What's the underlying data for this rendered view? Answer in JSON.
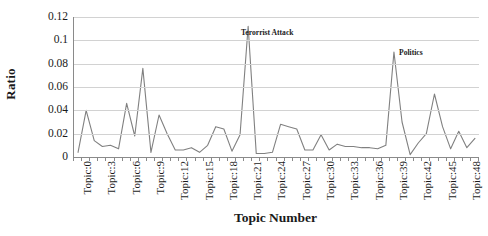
{
  "chart_data": {
    "type": "line",
    "title": "",
    "xlabel": "Topic Number",
    "ylabel": "Ratio",
    "ylim": [
      0,
      0.12
    ],
    "yticks": [
      "0",
      "0.02",
      "0.04",
      "0.06",
      "0.08",
      "0.1",
      "0.12"
    ],
    "ytick_values": [
      0,
      0.02,
      0.04,
      0.06,
      0.08,
      0.1,
      0.12
    ],
    "grid": true,
    "legend": "none",
    "series_color": "#808080",
    "x": [
      0,
      1,
      2,
      3,
      4,
      5,
      6,
      7,
      8,
      9,
      10,
      11,
      12,
      13,
      14,
      15,
      16,
      17,
      18,
      19,
      20,
      21,
      22,
      23,
      24,
      25,
      26,
      27,
      28,
      29,
      30,
      31,
      32,
      33,
      34,
      35,
      36,
      37,
      38,
      39,
      40,
      41,
      42,
      43,
      44,
      45,
      46,
      47,
      48,
      49
    ],
    "xtick_labels": [
      "Topic:0",
      "Topic:3",
      "Topic:6",
      "Topic:9",
      "Topic:12",
      "Topic:15",
      "Topic:18",
      "Topic:21",
      "Topic:24",
      "Topic:27",
      "Topic:30",
      "Topic:33",
      "Topic:36",
      "Topic:39",
      "Topic:42",
      "Topic:45",
      "Topic:48"
    ],
    "xtick_positions": [
      0,
      3,
      6,
      9,
      12,
      15,
      18,
      21,
      24,
      27,
      30,
      33,
      36,
      39,
      42,
      45,
      48
    ],
    "categories": [
      "Topic:0",
      "Topic:1",
      "Topic:2",
      "Topic:3",
      "Topic:4",
      "Topic:5",
      "Topic:6",
      "Topic:7",
      "Topic:8",
      "Topic:9",
      "Topic:10",
      "Topic:11",
      "Topic:12",
      "Topic:13",
      "Topic:14",
      "Topic:15",
      "Topic:16",
      "Topic:17",
      "Topic:18",
      "Topic:19",
      "Topic:20",
      "Topic:21",
      "Topic:22",
      "Topic:23",
      "Topic:24",
      "Topic:25",
      "Topic:26",
      "Topic:27",
      "Topic:28",
      "Topic:29",
      "Topic:30",
      "Topic:31",
      "Topic:32",
      "Topic:33",
      "Topic:34",
      "Topic:35",
      "Topic:36",
      "Topic:37",
      "Topic:38",
      "Topic:39",
      "Topic:40",
      "Topic:41",
      "Topic:42",
      "Topic:43",
      "Topic:44",
      "Topic:45",
      "Topic:46",
      "Topic:47",
      "Topic:48",
      "Topic:49"
    ],
    "values": [
      0.004,
      0.04,
      0.014,
      0.009,
      0.01,
      0.007,
      0.046,
      0.018,
      0.076,
      0.004,
      0.036,
      0.02,
      0.006,
      0.006,
      0.008,
      0.004,
      0.01,
      0.026,
      0.024,
      0.005,
      0.019,
      0.112,
      0.003,
      0.003,
      0.004,
      0.028,
      0.026,
      0.024,
      0.006,
      0.006,
      0.019,
      0.006,
      0.011,
      0.009,
      0.009,
      0.008,
      0.008,
      0.007,
      0.01,
      0.09,
      0.03,
      0.002,
      0.012,
      0.02,
      0.054,
      0.026,
      0.007,
      0.022,
      0.008,
      0.016
    ],
    "annotations": [
      {
        "text": "Terorrist Attack",
        "x_index": 21,
        "value": 0.112,
        "label_x": 241,
        "label_y": 28
      },
      {
        "text": "Politics",
        "x_index": 39,
        "value": 0.09,
        "label_x": 399,
        "label_y": 48
      }
    ]
  }
}
